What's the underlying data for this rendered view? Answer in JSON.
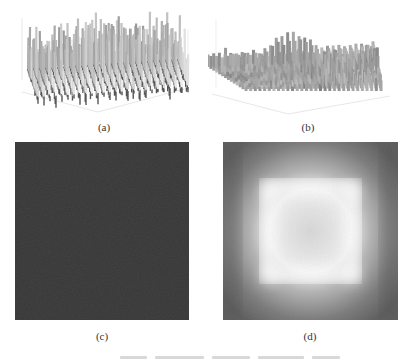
{
  "figure": {
    "panels": [
      {
        "id": "a",
        "label": "(a)",
        "kind": "3d-surface",
        "description": "dense spiky surface, noise-like peaks across whole plane"
      },
      {
        "id": "b",
        "label": "(b)",
        "kind": "3d-surface",
        "description": "surface with clustered peaks at corners and center, lower valleys between"
      },
      {
        "id": "c",
        "label": "(c)",
        "kind": "grayscale-map",
        "description": "dark, nearly uniform noisy intensity map"
      },
      {
        "id": "d",
        "label": "(d)",
        "kind": "grayscale-map",
        "description": "dark border with bright square ring in the middle"
      }
    ],
    "colors": {
      "background": "#ffffff",
      "surface_light": "#d8d8d8",
      "surface_dark": "#4a4a4a",
      "map_c": "#353535",
      "map_d_edge": "#5a5a5a",
      "map_d_center": "#f4f4f4"
    }
  }
}
